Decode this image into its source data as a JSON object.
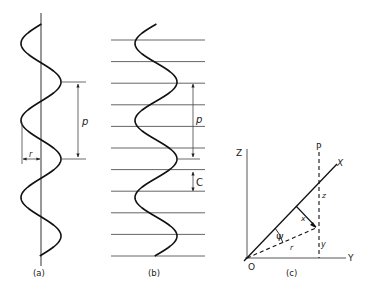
{
  "figure": {
    "panels": [
      {
        "id": "a",
        "caption": "(a)",
        "labels": {
          "pitch": "p",
          "radius": "r"
        }
      },
      {
        "id": "b",
        "caption": "(b)",
        "labels": {
          "pitch": "p",
          "spacing": "C"
        },
        "horizontal_line_count": 11
      },
      {
        "id": "c",
        "caption": "(c)",
        "labels": {
          "z_axis": "Z",
          "y_axis": "Y",
          "x_axis": "X",
          "point": "P",
          "origin": "O",
          "angle": "Ψ",
          "r": "r",
          "x": "x",
          "y": "y",
          "z": "z"
        }
      }
    ]
  },
  "colors": {
    "ink": "#222222",
    "grid": "#555555",
    "background": "#ffffff"
  }
}
